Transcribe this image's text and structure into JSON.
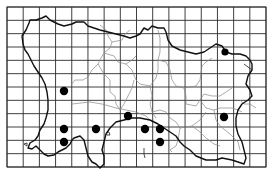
{
  "map": {
    "subject": "Jersey distribution map",
    "colors": {
      "background": "#ffffff",
      "grid": "#2a2a2a",
      "coast": "#111111",
      "parish_boundary": "#888888",
      "record_dot": "#000000"
    },
    "grid": {
      "x0": 7,
      "y0": 7,
      "x1": 266,
      "y1": 167,
      "cols": 16,
      "rows": 12
    },
    "records": [
      {
        "x": 64,
        "y": 91,
        "r": 4.2
      },
      {
        "x": 64,
        "y": 129,
        "r": 4.2
      },
      {
        "x": 64,
        "y": 142,
        "r": 4.2
      },
      {
        "x": 96,
        "y": 129,
        "r": 4.2
      },
      {
        "x": 128,
        "y": 116,
        "r": 4.2
      },
      {
        "x": 145,
        "y": 129,
        "r": 4.2
      },
      {
        "x": 160,
        "y": 129,
        "r": 4.2
      },
      {
        "x": 160,
        "y": 142,
        "r": 4.2
      },
      {
        "x": 224,
        "y": 117,
        "r": 4.2
      },
      {
        "x": 225,
        "y": 52,
        "r": 3.6
      }
    ]
  }
}
